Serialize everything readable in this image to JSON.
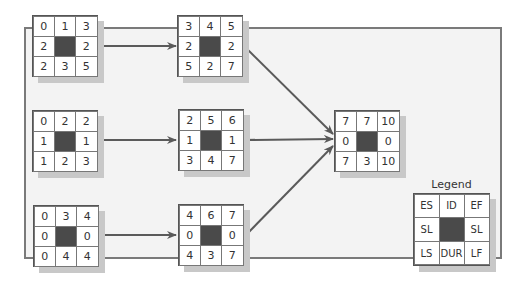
{
  "diagram": {
    "type": "activity-on-node network",
    "nodes": [
      {
        "id": "n1",
        "ES": "0",
        "ID": "",
        "EF": "1",
        "SL_left": "2",
        "SL_right": "2",
        "LS": "2",
        "DUR": "3",
        "LF": "5",
        "cells": [
          "0",
          "1",
          "3",
          "2",
          "",
          "2",
          "2",
          "3",
          "5"
        ]
      },
      {
        "id": "n2",
        "cells": [
          "3",
          "4",
          "5",
          "2",
          "",
          "2",
          "5",
          "2",
          "7"
        ]
      },
      {
        "id": "n3",
        "cells": [
          "0",
          "2",
          "2",
          "1",
          "",
          "1",
          "1",
          "2",
          "3"
        ]
      },
      {
        "id": "n4",
        "cells": [
          "2",
          "5",
          "6",
          "1",
          "",
          "1",
          "3",
          "4",
          "7"
        ]
      },
      {
        "id": "n5",
        "cells": [
          "0",
          "3",
          "4",
          "0",
          "",
          "0",
          "0",
          "4",
          "4"
        ]
      },
      {
        "id": "n6",
        "cells": [
          "4",
          "6",
          "7",
          "0",
          "",
          "0",
          "4",
          "3",
          "7"
        ]
      },
      {
        "id": "n7",
        "cells": [
          "7",
          "7",
          "10",
          "0",
          "",
          "0",
          "7",
          "3",
          "10"
        ]
      }
    ],
    "edges": [
      {
        "from": "n1",
        "to": "n2"
      },
      {
        "from": "n3",
        "to": "n4"
      },
      {
        "from": "n5",
        "to": "n6"
      },
      {
        "from": "n2",
        "to": "n7"
      },
      {
        "from": "n4",
        "to": "n7"
      },
      {
        "from": "n6",
        "to": "n7"
      }
    ]
  },
  "legend": {
    "title": "Legend",
    "cells": [
      "ES",
      "ID",
      "EF",
      "SL",
      "",
      "SL",
      "LS",
      "DUR",
      "LF"
    ]
  },
  "colors": {
    "frame_bg": "#f3f3f3",
    "frame_border": "#7a7a7a",
    "center_cell": "#4a4a4a",
    "arrow": "#5a5a5a"
  }
}
